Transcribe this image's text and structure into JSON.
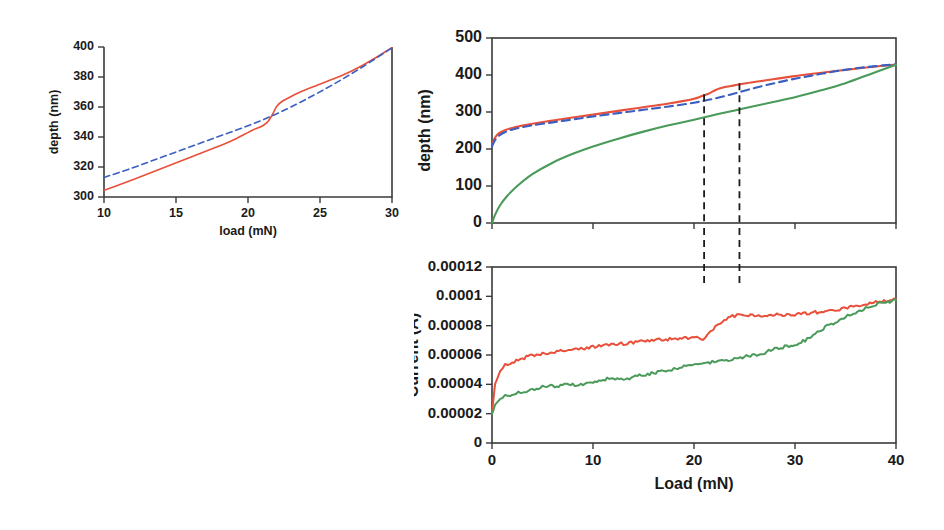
{
  "figure": {
    "panels": [
      "inset-depth-load",
      "main-depth-load",
      "main-current-load"
    ]
  },
  "colors": {
    "red": "#e8503a",
    "green": "#4a9a5a",
    "blue_dashed": "#3b5fc0",
    "axis": "#3a3a3a",
    "text": "#1a1a1a",
    "dashed_marker": "#1b1b1b"
  },
  "chart_data": [
    {
      "id": "inset-depth-load",
      "type": "line",
      "title": "",
      "xlabel": "load (mN)",
      "ylabel": "depth (nm)",
      "xlim": [
        10,
        30
      ],
      "ylim": [
        300,
        400
      ],
      "xticks": [
        10,
        15,
        20,
        25,
        30
      ],
      "yticks": [
        300,
        320,
        340,
        360,
        380,
        400
      ],
      "xtick_labels": [
        "10",
        "15",
        "20",
        "25",
        "30"
      ],
      "ytick_labels": [
        "300",
        "320",
        "340",
        "360",
        "380",
        "400"
      ],
      "grid": false,
      "legend": "none",
      "series": [
        {
          "name": "measured-depth",
          "color": "#e8503a",
          "style": "solid",
          "x": [
            10,
            10.6,
            11.3,
            12.0,
            12.8,
            13.6,
            14.4,
            15.2,
            16.0,
            16.8,
            17.6,
            18.4,
            19.2,
            19.8,
            20.3,
            20.8,
            21.1,
            21.4,
            21.7,
            22.0,
            22.4,
            22.9,
            23.4,
            24.0,
            24.8,
            25.6,
            26.4,
            27.2,
            28.0,
            28.8,
            29.4,
            30.0
          ],
          "y": [
            304.5,
            306.5,
            309.0,
            311.5,
            314.5,
            317.5,
            320.5,
            323.5,
            326.5,
            329.5,
            332.5,
            335.5,
            339.0,
            342.0,
            344.5,
            346.5,
            348.0,
            350.5,
            355.0,
            360.5,
            364.0,
            366.5,
            369.0,
            371.5,
            374.5,
            377.5,
            380.5,
            384.0,
            388.0,
            392.5,
            396.0,
            399.5
          ]
        },
        {
          "name": "fit-depth",
          "color": "#3b5fc0",
          "style": "dashed",
          "x": [
            10,
            12,
            14,
            16,
            18,
            20,
            22,
            24,
            26,
            28,
            30
          ],
          "y": [
            313.0,
            319.5,
            326.5,
            333.5,
            340.5,
            347.5,
            355.5,
            365.0,
            375.5,
            387.0,
            399.5
          ]
        }
      ]
    },
    {
      "id": "main-depth-load",
      "type": "line",
      "title": "",
      "xlabel": "Load (mN)",
      "ylabel": "depth (nm)",
      "xlim": [
        0,
        40
      ],
      "ylim": [
        0,
        500
      ],
      "xticks": [
        0,
        10,
        20,
        30,
        40
      ],
      "yticks": [
        0,
        100,
        200,
        300,
        400,
        500
      ],
      "xtick_labels": [
        "0",
        "10",
        "20",
        "30",
        "40"
      ],
      "ytick_labels": [
        "0",
        "100",
        "200",
        "300",
        "400",
        "500"
      ],
      "grid": false,
      "legend": "none",
      "annotations": [
        {
          "type": "vline",
          "x": 21.0,
          "label": "",
          "style": "dashed"
        },
        {
          "type": "vline",
          "x": 24.5,
          "label": "",
          "style": "dashed"
        }
      ],
      "series": [
        {
          "name": "depth-film-red",
          "color": "#e8503a",
          "style": "solid",
          "x": [
            0,
            0.2,
            0.5,
            0.9,
            1.4,
            2.0,
            2.8,
            3.6,
            4.6,
            5.8,
            7.0,
            8.5,
            10.0,
            11.5,
            13.0,
            14.5,
            16.0,
            17.5,
            19.0,
            20.0,
            20.6,
            21.0,
            21.3,
            21.7,
            22.1,
            22.6,
            23.2,
            24.0,
            25.0,
            26.5,
            28.0,
            30.0,
            32.0,
            34.0,
            36.0,
            38.0,
            40.0
          ],
          "y": [
            210,
            226,
            238,
            246,
            252,
            257,
            262,
            266,
            271,
            276,
            281,
            287,
            293,
            299,
            305,
            311,
            317,
            323,
            330,
            336,
            341,
            345,
            348,
            353,
            359,
            364,
            368,
            372,
            377,
            383,
            389,
            397,
            404,
            411,
            417,
            423,
            428
          ]
        },
        {
          "name": "depth-fit-blue",
          "color": "#3b5fc0",
          "style": "dashed",
          "x": [
            0,
            0.3,
            0.8,
            1.5,
            2.5,
            4.0,
            6.0,
            8.0,
            10.0,
            12.5,
            15.0,
            17.5,
            20.0,
            22.0,
            24.0,
            26.0,
            28.0,
            30.0,
            32.0,
            34.0,
            36.0,
            38.0,
            40.0
          ],
          "y": [
            207,
            224,
            238,
            248,
            256,
            264,
            272,
            280,
            288,
            297,
            306,
            315,
            325,
            336,
            350,
            365,
            378,
            390,
            400,
            410,
            418,
            424,
            429
          ]
        },
        {
          "name": "depth-substrate-green",
          "color": "#4a9a5a",
          "style": "solid",
          "x": [
            0,
            0.3,
            0.8,
            1.5,
            2.5,
            4.0,
            6.0,
            8.0,
            10.0,
            12.5,
            15.0,
            17.5,
            20.0,
            22.5,
            25.0,
            27.5,
            30.0,
            32.5,
            35.0,
            37.5,
            40.0
          ],
          "y": [
            0,
            22,
            48,
            73,
            100,
            132,
            163,
            187,
            207,
            228,
            247,
            264,
            279,
            295,
            310,
            325,
            340,
            358,
            378,
            403,
            428
          ]
        }
      ]
    },
    {
      "id": "main-current-load",
      "type": "line",
      "title": "",
      "xlabel": "Load (mN)",
      "ylabel": "Current (A)",
      "xlim": [
        0,
        40
      ],
      "ylim": [
        0,
        0.00012
      ],
      "xticks": [
        0,
        10,
        20,
        30,
        40
      ],
      "yticks": [
        0,
        2e-05,
        4e-05,
        6e-05,
        8e-05,
        0.0001,
        0.00012
      ],
      "xtick_labels": [
        "0",
        "10",
        "20",
        "30",
        "40"
      ],
      "ytick_labels": [
        "0",
        "0.00002",
        "0.00004",
        "0.00006",
        "0.00008",
        "0.0001",
        "0.00012"
      ],
      "grid": false,
      "legend": "none",
      "annotations": [
        {
          "type": "vline",
          "x": 21.0,
          "label": "",
          "style": "dashed"
        },
        {
          "type": "vline",
          "x": 24.5,
          "label": "",
          "style": "dashed"
        }
      ],
      "series": [
        {
          "name": "current-red",
          "color": "#e8503a",
          "style": "solid",
          "x": [
            0,
            0.3,
            0.8,
            1.3,
            1.8,
            2.4,
            3.0,
            3.6,
            4.2,
            4.8,
            5.4,
            6.0,
            6.8,
            7.6,
            8.4,
            9.2,
            10.0,
            10.8,
            11.6,
            12.4,
            13.2,
            14.0,
            14.8,
            15.6,
            16.4,
            17.2,
            18.0,
            18.8,
            19.6,
            20.3,
            20.8,
            21.0,
            21.3,
            21.7,
            22.1,
            22.6,
            23.2,
            23.8,
            24.5,
            25.2,
            26.0,
            27.0,
            28.0,
            29.0,
            30.0,
            31.0,
            32.0,
            33.0,
            34.0,
            35.0,
            36.0,
            37.0,
            38.0,
            39.0,
            40.0
          ],
          "y": [
            2.05e-05,
            4e-05,
            4.9e-05,
            5.3e-05,
            5.45e-05,
            5.62e-05,
            5.75e-05,
            5.9e-05,
            6e-05,
            6.08e-05,
            6.05e-05,
            6.15e-05,
            6.25e-05,
            6.32e-05,
            6.4e-05,
            6.48e-05,
            6.55e-05,
            6.6e-05,
            6.68e-05,
            6.72e-05,
            6.8e-05,
            6.85e-05,
            6.9e-05,
            6.97e-05,
            7.02e-05,
            7.06e-05,
            7.1e-05,
            7.12e-05,
            7.15e-05,
            7.16e-05,
            7.12e-05,
            7.05e-05,
            7.42e-05,
            7.6e-05,
            7.9e-05,
            8.2e-05,
            8.48e-05,
            8.62e-05,
            8.72e-05,
            8.74e-05,
            8.72e-05,
            8.72e-05,
            8.73e-05,
            8.75e-05,
            8.78e-05,
            8.84e-05,
            8.9e-05,
            8.98e-05,
            9.08e-05,
            9.2e-05,
            9.35e-05,
            9.5e-05,
            9.62e-05,
            9.7e-05,
            9.82e-05
          ]
        },
        {
          "name": "current-green",
          "color": "#4a9a5a",
          "style": "solid",
          "x": [
            0,
            0.3,
            0.8,
            1.3,
            1.8,
            2.4,
            3.0,
            3.6,
            4.4,
            5.2,
            6.0,
            6.8,
            7.6,
            8.4,
            9.2,
            10.0,
            10.8,
            11.6,
            12.4,
            13.2,
            14.0,
            14.8,
            15.6,
            16.4,
            17.2,
            18.0,
            18.8,
            19.6,
            20.4,
            21.2,
            22.0,
            22.8,
            23.6,
            24.4,
            25.2,
            26.0,
            26.8,
            27.6,
            28.4,
            29.2,
            30.0,
            31.0,
            32.0,
            33.0,
            34.0,
            35.0,
            36.0,
            37.0,
            38.0,
            39.0,
            40.0
          ],
          "y": [
            1.95e-05,
            2.6e-05,
            3e-05,
            3.18e-05,
            3.3e-05,
            3.4e-05,
            3.48e-05,
            3.55e-05,
            3.7e-05,
            3.92e-05,
            3.85e-05,
            3.92e-05,
            3.98e-05,
            3.95e-05,
            4.02e-05,
            4.08e-05,
            4.2e-05,
            4.42e-05,
            4.32e-05,
            4.28e-05,
            4.48e-05,
            4.62e-05,
            4.72e-05,
            4.82e-05,
            4.92e-05,
            5.02e-05,
            5.2e-05,
            5.32e-05,
            5.4e-05,
            5.48e-05,
            5.55e-05,
            5.62e-05,
            5.7e-05,
            5.82e-05,
            5.9e-05,
            5.98e-05,
            6.12e-05,
            6.32e-05,
            6.48e-05,
            6.6e-05,
            6.72e-05,
            7e-05,
            7.45e-05,
            7.9e-05,
            8.25e-05,
            8.6e-05,
            8.92e-05,
            9.2e-05,
            9.45e-05,
            9.58e-05,
            9.75e-05
          ]
        }
      ]
    }
  ]
}
